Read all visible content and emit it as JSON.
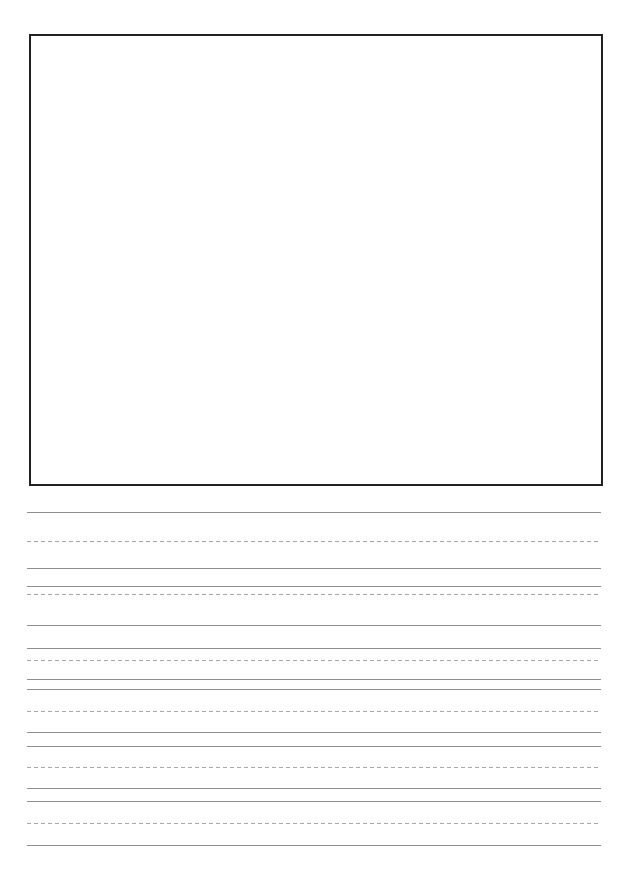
{
  "document": {
    "kind": "handwriting-practice-worksheet",
    "page_width": 623,
    "page_height": 878,
    "background_color": "#ffffff",
    "title_text": "",
    "body_text": "",
    "visible_text": ""
  },
  "drawing_box": {
    "name": "drawing-area",
    "label": "",
    "content_text": "",
    "x": 29,
    "y": 34,
    "width": 574,
    "height": 452,
    "border_color": "#222222",
    "border_width": 2,
    "fill_color": "#ffffff"
  },
  "writing_area": {
    "left": 27,
    "right": 601,
    "line_color_solid": "#8f8f8f",
    "line_color_dashed": "#a8a8a8",
    "dash_pattern": "4px 3px",
    "groups": [
      {
        "name": "line-group-1",
        "lines": [
          {
            "name": "baseline-top",
            "style": "solid",
            "y": 512
          },
          {
            "name": "midline",
            "style": "dashed",
            "y": 541
          },
          {
            "name": "baseline-bottom",
            "style": "solid",
            "y": 568
          }
        ]
      },
      {
        "name": "line-group-2",
        "lines": [
          {
            "name": "baseline-top",
            "style": "solid",
            "y": 586
          },
          {
            "name": "midline",
            "style": "dashed",
            "y": 594
          },
          {
            "name": "baseline-bottom",
            "style": "solid",
            "y": 625
          }
        ]
      },
      {
        "name": "line-group-3",
        "lines": [
          {
            "name": "baseline-top",
            "style": "solid",
            "y": 648
          },
          {
            "name": "midline",
            "style": "dashed",
            "y": 660
          },
          {
            "name": "baseline-bottom",
            "style": "solid",
            "y": 679
          }
        ]
      },
      {
        "name": "line-group-4",
        "lines": [
          {
            "name": "baseline-top",
            "style": "solid",
            "y": 689
          },
          {
            "name": "midline",
            "style": "dashed",
            "y": 711
          },
          {
            "name": "baseline-bottom",
            "style": "solid",
            "y": 732
          }
        ]
      },
      {
        "name": "line-group-5",
        "lines": [
          {
            "name": "baseline-top",
            "style": "solid",
            "y": 746
          },
          {
            "name": "midline",
            "style": "dashed",
            "y": 767
          },
          {
            "name": "baseline-bottom",
            "style": "solid",
            "y": 788
          }
        ]
      },
      {
        "name": "line-group-6",
        "lines": [
          {
            "name": "baseline-top",
            "style": "solid",
            "y": 801
          },
          {
            "name": "midline",
            "style": "dashed",
            "y": 823
          },
          {
            "name": "baseline-bottom",
            "style": "solid",
            "y": 845
          }
        ]
      }
    ]
  }
}
